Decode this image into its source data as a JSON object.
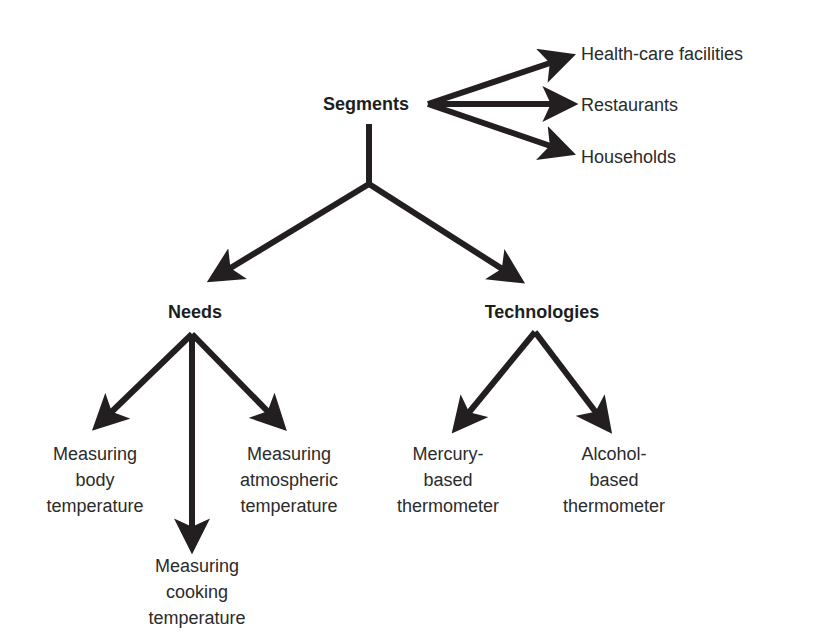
{
  "diagram": {
    "root": {
      "label": "Segments",
      "children": [
        "Health-care facilities",
        "Restaurants",
        "Households"
      ]
    },
    "needs": {
      "label": "Needs",
      "children": [
        {
          "lines": [
            "Measuring",
            "body",
            "temperature"
          ]
        },
        {
          "lines": [
            "Measuring",
            "cooking",
            "temperature"
          ]
        },
        {
          "lines": [
            "Measuring",
            "atmospheric",
            "temperature"
          ]
        }
      ]
    },
    "technologies": {
      "label": "Technologies",
      "children": [
        {
          "lines": [
            "Mercury-",
            "based",
            "thermometer"
          ]
        },
        {
          "lines": [
            "Alcohol-",
            "based",
            "thermometer"
          ]
        }
      ]
    },
    "colors": {
      "arrow": "#231f20",
      "text": "#2b2b2b"
    }
  }
}
